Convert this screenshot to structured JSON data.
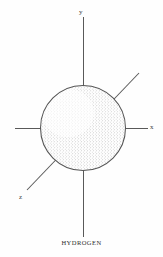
{
  "figure": {
    "caption": "HYDROGEN",
    "style": "stippled line drawing",
    "background_color": "#fefefe",
    "ink_color": "#4a4a4a",
    "stipple_color": "#6b6b6b"
  },
  "axes": {
    "x": {
      "label": "x",
      "orientation": "horizontal",
      "line_color": "#595959"
    },
    "y": {
      "label": "y",
      "orientation": "vertical",
      "line_color": "#595959"
    },
    "z": {
      "label": "z",
      "orientation": "diagonal",
      "line_color": "#595959"
    }
  },
  "sphere": {
    "center_x": 83,
    "center_y": 128,
    "radius": 43,
    "outline_color": "#555555",
    "shading": "stipple-dense-right-bottom"
  }
}
